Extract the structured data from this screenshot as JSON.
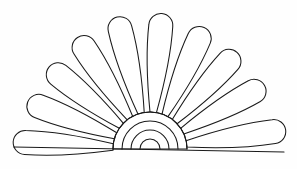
{
  "artwork": {
    "title": "Fan shell line drawing",
    "kind": "line-art",
    "background_color": "#fefefe",
    "stroke_color": "#1a1a1a",
    "fill_color": "#ffffff",
    "stroke_width": 1.05,
    "canvas": {
      "width": 297,
      "height": 169
    }
  },
  "fan": {
    "name": "fan-petal-group",
    "hub_center": {
      "x": 150,
      "y": 149
    },
    "petal_count": 10,
    "angle_start_deg": 180,
    "angle_end_deg": 0,
    "tip_radius_outer": 138,
    "tip_radius_top": 137,
    "petal_half_width_deg": 8.1,
    "root_radius": 37,
    "petals": [
      {
        "index": 0,
        "label": "petal-left-1",
        "center_angle_deg": 177,
        "length": 137,
        "width": 24
      },
      {
        "index": 1,
        "label": "petal-left-2",
        "center_angle_deg": 159,
        "length": 131,
        "width": 24
      },
      {
        "index": 2,
        "label": "petal-left-3",
        "center_angle_deg": 141,
        "length": 130,
        "width": 24
      },
      {
        "index": 3,
        "label": "petal-left-4",
        "center_angle_deg": 123,
        "length": 133,
        "width": 24
      },
      {
        "index": 4,
        "label": "petal-left-5",
        "center_angle_deg": 104,
        "length": 136,
        "width": 24
      },
      {
        "index": 5,
        "label": "petal-right-5",
        "center_angle_deg": 85,
        "length": 136,
        "width": 24
      },
      {
        "index": 6,
        "label": "petal-right-4",
        "center_angle_deg": 66,
        "length": 133,
        "width": 24
      },
      {
        "index": 7,
        "label": "petal-right-3",
        "center_angle_deg": 48,
        "length": 130,
        "width": 24
      },
      {
        "index": 8,
        "label": "petal-right-2",
        "center_angle_deg": 29,
        "length": 131,
        "width": 24
      },
      {
        "index": 9,
        "label": "petal-right-1",
        "center_angle_deg": 8,
        "length": 137,
        "width": 24
      }
    ]
  },
  "hub": {
    "name": "hub-concentric-arcs",
    "arc_count": 4,
    "radii": [
      37,
      28,
      19,
      10
    ],
    "arc_span_deg": 180
  },
  "baseline": {
    "name": "base-line",
    "x1": 14,
    "y1": 147,
    "x2": 284,
    "y2": 152
  }
}
